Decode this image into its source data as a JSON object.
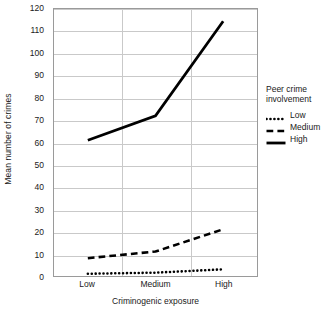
{
  "chart_data": {
    "type": "line",
    "title": "",
    "xlabel": "Criminogenic exposure",
    "ylabel": "Mean number of crimes",
    "categories": [
      "Low",
      "Medium",
      "High"
    ],
    "ylim": [
      0,
      120
    ],
    "yticks": [
      0,
      10,
      20,
      30,
      40,
      50,
      60,
      70,
      80,
      90,
      100,
      110,
      120
    ],
    "ytick_labels": [
      "0",
      "10",
      "20",
      "30",
      "40",
      "50",
      "60",
      "70",
      "80",
      "90",
      "100",
      "110",
      "120"
    ],
    "grid": "horizontal-and-vertical",
    "legend_position": "right",
    "legend_title": "Peer crime\ninvolvement",
    "series": [
      {
        "name": "Low",
        "values": [
          1,
          1.5,
          3
        ],
        "style": "dotted",
        "color": "#000000",
        "width": 2.6
      },
      {
        "name": "Medium",
        "values": [
          8,
          11,
          21
        ],
        "style": "dashed",
        "color": "#000000",
        "width": 2.6
      },
      {
        "name": "High",
        "values": [
          61,
          72,
          114.5
        ],
        "style": "solid",
        "color": "#000000",
        "width": 2.8
      }
    ]
  },
  "axes": {
    "frame_color": "#9a9a9a",
    "grid_color": "#c9c9c9"
  }
}
